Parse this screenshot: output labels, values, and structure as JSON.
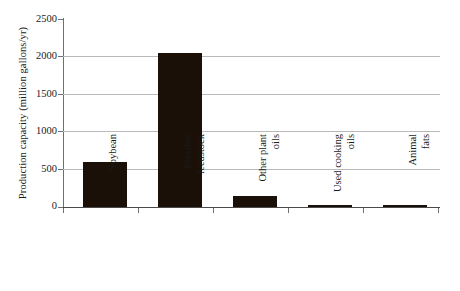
{
  "chart_data": {
    "type": "bar",
    "title": "",
    "xlabel": "",
    "ylabel": "Production capacity (million gallons/yr)",
    "categories": [
      "Soybean",
      "Flexible feedstock",
      "Other plant oils",
      "Used cooking oils",
      "Animal fats"
    ],
    "category_lines": [
      [
        "Soybean",
        ""
      ],
      [
        "Flexible",
        "feedstock"
      ],
      [
        "Other plant",
        "oils"
      ],
      [
        "Used cooking",
        "oils"
      ],
      [
        "Animal",
        "fats"
      ]
    ],
    "values": [
      600,
      2050,
      150,
      30,
      20
    ],
    "ylim": [
      0,
      2500
    ],
    "ytick_labels": [
      "0",
      "500",
      "1000",
      "1500",
      "2000",
      "2500"
    ],
    "ytick_values": [
      0,
      500,
      1000,
      1500,
      2000,
      2500
    ],
    "grid": true,
    "legend": "none",
    "bar_color": "#1a1008",
    "gridline_color": "#b9b9b9",
    "axis_color": "#6f6f6f"
  }
}
